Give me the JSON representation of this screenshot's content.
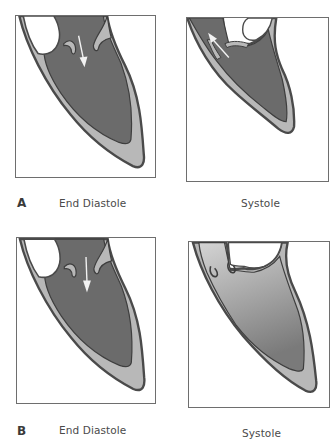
{
  "figure": {
    "panels": [
      {
        "letter": "A",
        "left_caption": "End Diastole",
        "right_caption": "Systole",
        "left_arrow": "inflow-arrow-down",
        "right_arrow": "outflow-arrow-up-left"
      },
      {
        "letter": "B",
        "left_caption": "End Diastole",
        "right_caption": "Systole",
        "left_arrow": "inflow-arrow-down",
        "right_fill": "gradient"
      }
    ]
  },
  "colors": {
    "blood_dark": "#6b6b6b",
    "wall_light": "#b8b8b8",
    "outline": "#4a4a4a",
    "frame_border": "#6e6e6e",
    "gradient_top": "#d4d4d4",
    "gradient_bottom": "#7a7a7a",
    "arrow": "#f2f2f2"
  }
}
